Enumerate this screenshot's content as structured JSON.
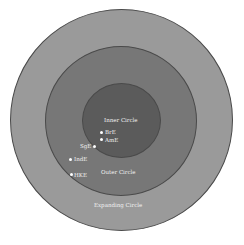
{
  "diagram": {
    "circles": [
      {
        "label": "Expanding Circle",
        "color": "#9a9a9a"
      },
      {
        "label": "Outer Circle",
        "color": "#777777"
      },
      {
        "label": "Inner Circle",
        "color": "#5b5b5b"
      }
    ],
    "points": [
      {
        "label": "BrE"
      },
      {
        "label": "AmE"
      },
      {
        "label": "SgE"
      },
      {
        "label": "IndE"
      },
      {
        "label": "HKE"
      }
    ]
  }
}
